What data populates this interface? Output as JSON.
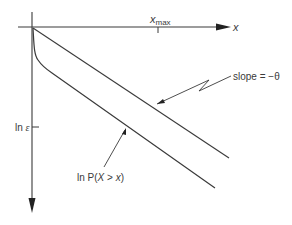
{
  "diagram": {
    "axes": {
      "x_label": "x",
      "x_tick_label_main": "x",
      "x_tick_label_sub": "max",
      "y_tick_label_prefix": "ln ",
      "y_tick_label_symbol": "ε"
    },
    "annotations": {
      "slope_label": "slope = −θ",
      "curve_label_prefix": "ln P(",
      "curve_label_var": "X",
      "curve_label_op": " > ",
      "curve_label_x": "x",
      "curve_label_suffix": ")"
    },
    "colors": {
      "line": "#3a3a3a",
      "background": "#ffffff"
    }
  }
}
